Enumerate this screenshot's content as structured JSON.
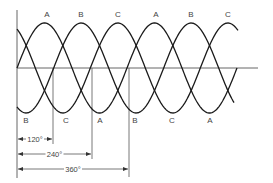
{
  "diagram": {
    "axes": {
      "origin": [
        17,
        68
      ],
      "x_end": 258,
      "y_top": 10,
      "y_bottom": 178
    },
    "wave": {
      "period_px": 110,
      "amplitude_px": 45,
      "center_y": 68,
      "start_x": 17,
      "stroke_color": "#1a1a1a"
    },
    "phases": [
      {
        "name": "A",
        "phase_deg": 0,
        "end_x": 237
      },
      {
        "name": "B",
        "phase_deg": 120,
        "end_x": 234
      },
      {
        "name": "C",
        "phase_deg": 240,
        "end_x": 238
      }
    ],
    "peak_labels": [
      {
        "text": "A",
        "x": 47,
        "y": 17
      },
      {
        "text": "B",
        "x": 81,
        "y": 17
      },
      {
        "text": "C",
        "x": 118,
        "y": 17
      },
      {
        "text": "A",
        "x": 156,
        "y": 17
      },
      {
        "text": "B",
        "x": 191,
        "y": 17
      },
      {
        "text": "C",
        "x": 228,
        "y": 17
      }
    ],
    "trough_labels": [
      {
        "text": "B",
        "x": 26,
        "y": 123
      },
      {
        "text": "C",
        "x": 66,
        "y": 123
      },
      {
        "text": "A",
        "x": 100,
        "y": 123
      },
      {
        "text": "B",
        "x": 135,
        "y": 123
      },
      {
        "text": "C",
        "x": 172,
        "y": 123
      },
      {
        "text": "A",
        "x": 210,
        "y": 123
      }
    ],
    "dimensions": [
      {
        "label": "120°",
        "x_end": 53,
        "y": 139,
        "guide_bottom": 144
      },
      {
        "label": "240°",
        "x_end": 92,
        "y": 154,
        "guide_bottom": 159
      },
      {
        "label": "360°",
        "x_end": 129,
        "y": 169,
        "guide_bottom": 177
      }
    ]
  }
}
